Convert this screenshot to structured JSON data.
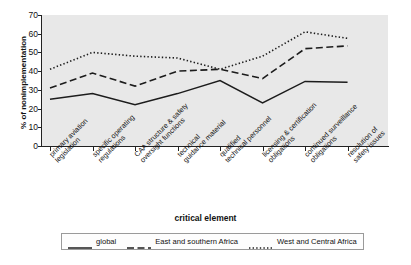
{
  "chart_data": {
    "type": "line",
    "title": "",
    "xlabel": "critical element",
    "ylabel": "% of nonimplementation",
    "ylim": [
      0,
      70
    ],
    "yticks": [
      0,
      10,
      20,
      30,
      40,
      50,
      60,
      70
    ],
    "grid": false,
    "legend_position": "bottom",
    "categories": [
      "primary aviation legislation",
      "specific operating regulations",
      "CAA structure & safety oversight functions",
      "technical guidance material",
      "qualified technical personnel",
      "licensing & certification obligations",
      "continued surveillance obligations",
      "resolution of safety issues"
    ],
    "category_lines": [
      [
        "primary aviation",
        "legislation"
      ],
      [
        "specific operating",
        "regulations"
      ],
      [
        "CAA structure & safety",
        "oversight functions"
      ],
      [
        "technical",
        "guidance material"
      ],
      [
        "qualified",
        "technical personnel"
      ],
      [
        "licensing & certification",
        "obligations"
      ],
      [
        "continued surveillance",
        "obligations"
      ],
      [
        "resolution of",
        "safety issues"
      ]
    ],
    "series": [
      {
        "name": "global",
        "style": "solid",
        "color": "#1c1c1c",
        "values": [
          25,
          28,
          22,
          28,
          35,
          23,
          34.5,
          34
        ]
      },
      {
        "name": "East and southern Africa",
        "style": "dashed",
        "color": "#1c1c1c",
        "values": [
          31,
          39,
          32,
          40,
          41,
          36,
          52,
          53.5
        ]
      },
      {
        "name": "West and Central Africa",
        "style": "dotted",
        "color": "#1c1c1c",
        "values": [
          41,
          50,
          48,
          47,
          41,
          48,
          61,
          57.5
        ]
      }
    ]
  },
  "axes": {
    "y_title": "% of nonimplementation",
    "x_title": "critical element",
    "y_tick_labels": [
      "70",
      "60",
      "50",
      "40",
      "30",
      "20",
      "10",
      "0"
    ]
  },
  "legend": {
    "entries": [
      {
        "label": "global",
        "style": "solid"
      },
      {
        "label": "East and southern Africa",
        "style": "dashed"
      },
      {
        "label": "West and Central Africa",
        "style": "dotted"
      }
    ]
  },
  "colors": {
    "plot_background": "#e8e8e8",
    "page_background": "#ffffff",
    "ink": "#1c1c1c",
    "legend_border": "#9a9a9a"
  }
}
